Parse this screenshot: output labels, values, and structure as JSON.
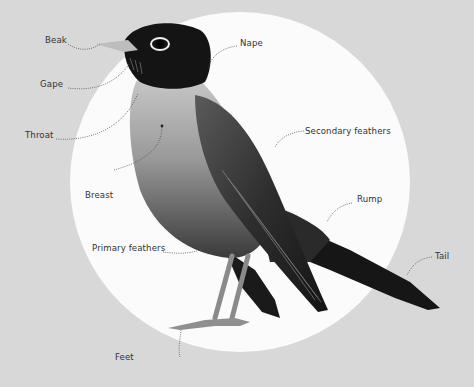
{
  "diagram": {
    "colors": {
      "background": "#d8d8d8",
      "circle": "#fbfbfb",
      "label_text": "#333333",
      "leader_line": "#555555"
    },
    "labels": [
      {
        "id": "beak",
        "text": "Beak"
      },
      {
        "id": "gape",
        "text": "Gape"
      },
      {
        "id": "throat",
        "text": "Throat"
      },
      {
        "id": "breast",
        "text": "Breast"
      },
      {
        "id": "primary-feathers",
        "text": "Primary feathers"
      },
      {
        "id": "feet",
        "text": "Feet"
      },
      {
        "id": "nape",
        "text": "Nape"
      },
      {
        "id": "secondary-feathers",
        "text": "Secondary feathers"
      },
      {
        "id": "rump",
        "text": "Rump"
      },
      {
        "id": "tail",
        "text": "Tail"
      }
    ]
  }
}
